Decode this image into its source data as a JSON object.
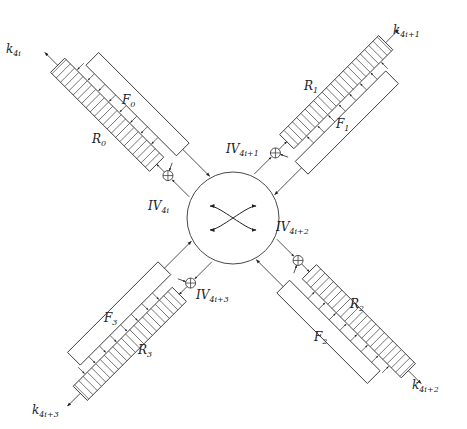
{
  "diagram": {
    "type": "block-diagram",
    "center_switch": {
      "label": "",
      "glyph": "crossed-arrows"
    },
    "arms": [
      {
        "id": 0,
        "register": "R",
        "register_sub": "0",
        "function": "F",
        "function_sub": "0",
        "iv": "IV",
        "iv_sub": "4i",
        "key": "k",
        "key_sub": "4i"
      },
      {
        "id": 1,
        "register": "R",
        "register_sub": "1",
        "function": "F",
        "function_sub": "1",
        "iv": "IV",
        "iv_sub": "4i+1",
        "key": "k",
        "key_sub": "4i+1"
      },
      {
        "id": 2,
        "register": "R",
        "register_sub": "2",
        "function": "F",
        "function_sub": "2",
        "iv": "IV",
        "iv_sub": "4i+2",
        "key": "k",
        "key_sub": "4i+2"
      },
      {
        "id": 3,
        "register": "R",
        "register_sub": "3",
        "function": "F",
        "function_sub": "3",
        "iv": "IV",
        "iv_sub": "4i+3",
        "key": "k",
        "key_sub": "4i+3"
      }
    ],
    "colors": {
      "stroke": "#333333",
      "background": "#ffffff"
    }
  }
}
